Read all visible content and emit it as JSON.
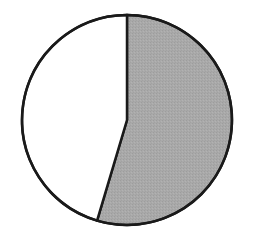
{
  "chart_data": {
    "type": "pie",
    "title": "",
    "legend": [],
    "labels": [
      "Shaded segment",
      "Unshaded segment"
    ],
    "values": [
      54.6,
      45.4
    ],
    "units": "percent (estimated from angles)",
    "start_angle_deg": 0,
    "direction": "clockwise",
    "colors": [
      "#a9a9a9",
      "#ffffff"
    ],
    "outline_color": "#1a1a1a"
  },
  "geometry": {
    "cx": 127,
    "cy": 120,
    "r": 105
  }
}
